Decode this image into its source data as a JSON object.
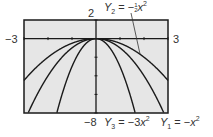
{
  "chart_data": {
    "type": "line",
    "title": "",
    "xlabel": "",
    "ylabel": "",
    "xlim": [
      -3,
      3
    ],
    "ylim": [
      -8,
      2
    ],
    "xscale": 1,
    "yscale": 2,
    "grid": false,
    "window_labels": {
      "xmin": "−3",
      "xmax": "3",
      "ymax": "2",
      "ymin": "−8"
    },
    "series": [
      {
        "name": "Y1 = −x²",
        "coef": -1
      },
      {
        "name": "Y2 = −½x²",
        "coef": -0.5
      },
      {
        "name": "Y3 = −3x²",
        "coef": -3
      }
    ],
    "annotations": [
      {
        "text": "Y2 = −½x²",
        "points_to": "Y2",
        "position": "top"
      },
      {
        "text": "Y3 = −3x²",
        "position": "bottom"
      },
      {
        "text": "Y1 = −x²",
        "position": "bottom"
      }
    ]
  },
  "labels": {
    "xmin": "−3",
    "xmax": "3",
    "ymax": "2",
    "ymin": "−8",
    "y2": {
      "var": "Y",
      "sub": "2",
      "eq": " = −",
      "frac_num": "1",
      "frac_den": "2",
      "x": "x",
      "pow": "2"
    },
    "y3": {
      "var": "Y",
      "sub": "3",
      "eq": " = −3",
      "x": "x",
      "pow": "2"
    },
    "y1": {
      "var": "Y",
      "sub": "1",
      "eq": " = −",
      "x": "x",
      "pow": "2"
    }
  },
  "colors": {
    "plot_bg": "#e6e6e6",
    "line": "#1a1a1a",
    "frame": "#1a1a1a"
  }
}
